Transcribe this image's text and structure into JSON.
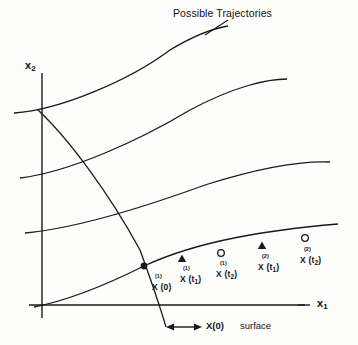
{
  "figure": {
    "title": "Possible Trajectories",
    "background_color": "#fdfdfc",
    "stroke_color": "#1a1a1a"
  },
  "axes": {
    "y_label_main": "x",
    "y_label_sub": "2",
    "x_label_main": "x",
    "x_label_sub": "1"
  },
  "annotations": {
    "surface_label": "X(0)",
    "surface_word": "surface"
  },
  "points": [
    {
      "id": "x1-t0",
      "marker": "filled-dot",
      "superscript": "(1)",
      "base": "X (0)",
      "sub": "",
      "x": 144,
      "y": 266,
      "label_x": 152,
      "label_y": 283,
      "sup_x": 155,
      "sup_y": 273
    },
    {
      "id": "x1-t1",
      "marker": "filled-triangle",
      "superscript": "(1)",
      "base": "X (t",
      "sub": "1",
      "x": 182,
      "y": 259,
      "label_x": 180,
      "label_y": 275,
      "sup_x": 183,
      "sup_y": 265
    },
    {
      "id": "x1-t2",
      "marker": "open-circle",
      "superscript": "(1)",
      "base": "X (t",
      "sub": "2",
      "x": 221,
      "y": 253,
      "label_x": 216,
      "label_y": 270,
      "sup_x": 220,
      "sup_y": 260
    },
    {
      "id": "x2-t1",
      "marker": "filled-triangle",
      "superscript": "(2)",
      "base": "X (t",
      "sub": "1",
      "x": 262,
      "y": 246,
      "label_x": 258,
      "label_y": 263,
      "sup_x": 262,
      "sup_y": 253
    },
    {
      "id": "x2-t2",
      "marker": "open-circle",
      "superscript": "(2)",
      "base": "X (t",
      "sub": "2",
      "x": 305,
      "y": 238,
      "label_x": 300,
      "label_y": 256,
      "sup_x": 304,
      "sup_y": 246
    }
  ],
  "chart_data": {
    "type": "line",
    "title": "Possible Trajectories",
    "xlabel": "x1",
    "ylabel": "x2",
    "grid": false,
    "legend": null,
    "series": [
      {
        "name": "trajectory-1-top",
        "path": "M 14,113 C 60,110 130,80 170,50 C 195,35 215,28 228,26"
      },
      {
        "name": "trajectory-2",
        "path": "M 20,178 C 70,172 140,140 190,110 C 235,86 268,79 287,79"
      },
      {
        "name": "trajectory-3",
        "path": "M 25,233 C 80,228 150,205 205,185 C 265,166 305,161 330,162"
      },
      {
        "name": "trajectory-4-marked",
        "path": "M 34,307 C 70,300 110,283 144,266 C 200,240 270,230 338,224"
      },
      {
        "name": "x0-surface",
        "path": "M 38,110 C 70,140 110,195 140,250 C 152,283 161,310 166,327"
      }
    ]
  }
}
